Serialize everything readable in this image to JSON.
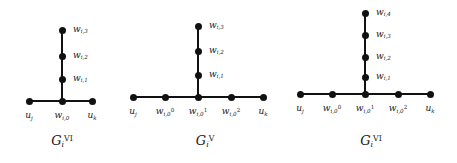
{
  "figure": {
    "type": "graph-diagram",
    "background_color": "#ffffff",
    "node_color": "#111111",
    "edge_color": "#111111",
    "panels": [
      {
        "caption_base": "G",
        "caption_sub": "i",
        "caption_sup": "VI",
        "baseline_labels": [
          "u_j",
          "w_{i,0}",
          "u_k"
        ],
        "baseline_label_text": [
          "u",
          "w",
          "u"
        ],
        "chain_labels": [
          "w_{i,1}",
          "w_{i,2}",
          "w_{i,3}"
        ],
        "baseline_node_count": 3,
        "chain_node_count": 3,
        "nodes": {
          "baseline": [
            {
              "name": "u_j",
              "base": "u",
              "sub": "j",
              "sup": ""
            },
            {
              "name": "w_i0",
              "base": "w",
              "sub": "i,0",
              "sup": ""
            },
            {
              "name": "u_k",
              "base": "u",
              "sub": "k",
              "sup": ""
            }
          ],
          "chain": [
            {
              "name": "w_i1",
              "base": "w",
              "sub": "i,1",
              "sup": ""
            },
            {
              "name": "w_i2",
              "base": "w",
              "sub": "i,2",
              "sup": ""
            },
            {
              "name": "w_i3",
              "base": "w",
              "sub": "i,3",
              "sup": ""
            }
          ]
        }
      },
      {
        "caption_base": "G",
        "caption_sub": "i",
        "caption_sup": "V",
        "baseline_node_count": 5,
        "chain_node_count": 3,
        "nodes": {
          "baseline": [
            {
              "name": "u_j",
              "base": "u",
              "sub": "j",
              "sup": ""
            },
            {
              "name": "w_i0_0",
              "base": "w",
              "sub": "i,0",
              "sup": "0"
            },
            {
              "name": "w_i0_1",
              "base": "w",
              "sub": "i,0",
              "sup": "1"
            },
            {
              "name": "w_i0_2",
              "base": "w",
              "sub": "i,0",
              "sup": "2"
            },
            {
              "name": "u_k",
              "base": "u",
              "sub": "k",
              "sup": ""
            }
          ],
          "chain": [
            {
              "name": "w_i1",
              "base": "w",
              "sub": "i,1",
              "sup": ""
            },
            {
              "name": "w_i2",
              "base": "w",
              "sub": "i,2",
              "sup": ""
            },
            {
              "name": "w_i3",
              "base": "w",
              "sub": "i,3",
              "sup": ""
            }
          ]
        }
      },
      {
        "caption_base": "G",
        "caption_sub": "i",
        "caption_sup": "VI",
        "baseline_node_count": 5,
        "chain_node_count": 4,
        "nodes": {
          "baseline": [
            {
              "name": "u_j",
              "base": "u",
              "sub": "j",
              "sup": ""
            },
            {
              "name": "w_i0_0",
              "base": "w",
              "sub": "i,0",
              "sup": "0"
            },
            {
              "name": "w_i0_1",
              "base": "w",
              "sub": "i,0",
              "sup": "1"
            },
            {
              "name": "w_i0_2",
              "base": "w",
              "sub": "i,0",
              "sup": "2"
            },
            {
              "name": "u_k",
              "base": "u",
              "sub": "k",
              "sup": ""
            }
          ],
          "chain": [
            {
              "name": "w_i1",
              "base": "w",
              "sub": "i,1",
              "sup": ""
            },
            {
              "name": "w_i2",
              "base": "w",
              "sub": "i,2",
              "sup": ""
            },
            {
              "name": "w_i3",
              "base": "w",
              "sub": "i,3",
              "sup": ""
            },
            {
              "name": "w_i4",
              "base": "w",
              "sub": "i,4",
              "sup": ""
            }
          ]
        }
      }
    ]
  }
}
